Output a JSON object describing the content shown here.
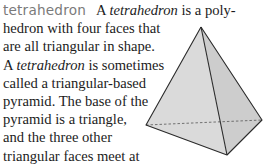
{
  "entry": {
    "headword": "tetrahedron",
    "lines": [
      {
        "pre": "A ",
        "term": "tetrahedron",
        "post": " is a poly-"
      },
      {
        "text": "hedron with four faces that"
      },
      {
        "text": "are all triangular in shape."
      },
      {
        "pre": "A ",
        "term": "tetrahedron",
        "post": " is sometimes"
      },
      {
        "text": "called a triangular-based"
      },
      {
        "text": "pyramid. The base of the"
      },
      {
        "text": "pyramid is a triangle,"
      },
      {
        "text": "and the three other"
      },
      {
        "text": "triangular faces meet at"
      },
      {
        "text": "a point."
      }
    ]
  },
  "figure": {
    "name": "tetrahedron",
    "colors": {
      "left_face": "#dadada",
      "right_face": "#cdcdcd",
      "edge": "#2a2a2a",
      "hidden_edge": "#555555"
    }
  }
}
